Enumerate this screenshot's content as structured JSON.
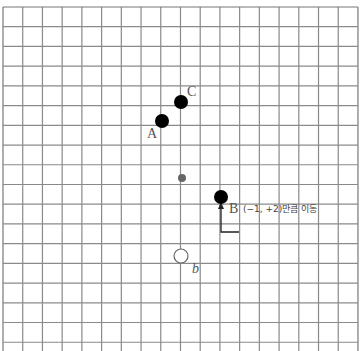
{
  "board": {
    "grid": {
      "x0": 3,
      "y0": 7,
      "step": 19.72,
      "cols": 18,
      "rows": 18,
      "line_color": "#8a8a8a",
      "border_color": "#777777"
    },
    "stones": [
      {
        "id": "A",
        "label": "A",
        "color": "black",
        "cx": 162,
        "cy": 121,
        "r": 7,
        "label_x": 147,
        "label_y": 138
      },
      {
        "id": "C",
        "label": "C",
        "color": "black",
        "cx": 181,
        "cy": 102,
        "r": 7,
        "label_x": 187,
        "label_y": 96
      },
      {
        "id": "B",
        "label": "B",
        "color": "black",
        "cx": 221,
        "cy": 197,
        "r": 7,
        "label_x": 229,
        "label_y": 213
      },
      {
        "id": "b",
        "label": "b",
        "color": "white",
        "cx": 181,
        "cy": 256,
        "r": 7,
        "label_x": 192,
        "label_y": 273
      }
    ],
    "center_point": {
      "cx": 182,
      "cy": 178,
      "r": 4,
      "color": "#666666"
    },
    "annotation": {
      "text": "(−1, +2)만큼 이동",
      "x": 243,
      "y": 212
    },
    "arrow": {
      "start_x": 239,
      "start_y": 232,
      "corner_x": 221,
      "corner_y": 232,
      "end_x": 221,
      "end_y": 205
    }
  }
}
